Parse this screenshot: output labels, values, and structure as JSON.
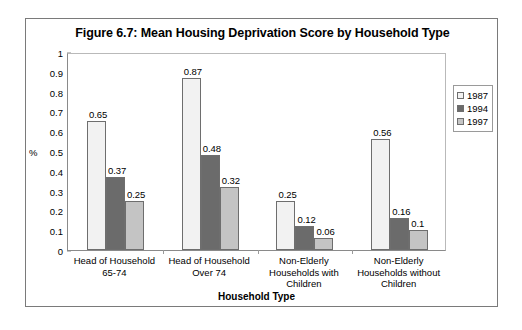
{
  "chart_data": {
    "type": "bar",
    "title": "Figure 6.7: Mean Housing Deprivation Score by Household Type",
    "xlabel": "Household Type",
    "ylabel": "%",
    "ylim": [
      0,
      1
    ],
    "ytick_labels": [
      "1",
      "0.9",
      "0.8",
      "0.7",
      "0.6",
      "0.5",
      "0.4",
      "0.3",
      "0.2",
      "0.1",
      "0"
    ],
    "ytick_values": [
      1,
      0.9,
      0.8,
      0.7,
      0.6,
      0.5,
      0.4,
      0.3,
      0.2,
      0.1,
      0
    ],
    "grid": false,
    "legend_position": "right",
    "categories": [
      "Head of Household 65-74",
      "Head of Household Over 74",
      "Non-Elderly Households with Children",
      "Non-Elderly Households without Children"
    ],
    "category_lines": [
      [
        "Head of Household",
        "65-74"
      ],
      [
        "Head of Household",
        "Over 74"
      ],
      [
        "Non-Elderly",
        "Households with",
        "Children"
      ],
      [
        "Non-Elderly",
        "Households without",
        "Children"
      ]
    ],
    "series": [
      {
        "name": "1987",
        "color": "#f2f2f2",
        "values": [
          0.65,
          0.87,
          0.25,
          0.56
        ],
        "labels": [
          "0.65",
          "0.87",
          "0.25",
          "0.56"
        ]
      },
      {
        "name": "1994",
        "color": "#6b6b6b",
        "values": [
          0.37,
          0.48,
          0.12,
          0.16
        ],
        "labels": [
          "0.37",
          "0.48",
          "0.12",
          "0.16"
        ]
      },
      {
        "name": "1997",
        "color": "#c4c4c4",
        "values": [
          0.25,
          0.32,
          0.06,
          0.1
        ],
        "labels": [
          "0.25",
          "0.32",
          "0.06",
          "0.1"
        ]
      }
    ]
  },
  "legend": {
    "items": [
      {
        "label": "1987",
        "color": "#f2f2f2"
      },
      {
        "label": "1994",
        "color": "#6b6b6b"
      },
      {
        "label": "1997",
        "color": "#c4c4c4"
      }
    ]
  }
}
